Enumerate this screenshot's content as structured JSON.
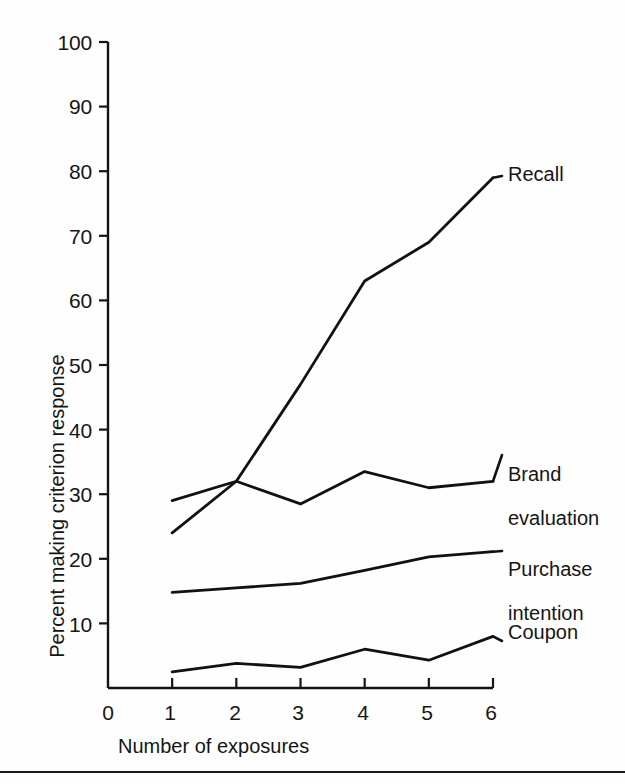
{
  "chart_data": {
    "type": "line",
    "title": "",
    "xlabel": "Number of exposures",
    "ylabel": "Percent making criterion response",
    "x": [
      1,
      2,
      3,
      4,
      5,
      6
    ],
    "xlim": [
      0,
      6
    ],
    "ylim": [
      0,
      100
    ],
    "xticks": [
      "0",
      "1",
      "2",
      "3",
      "4",
      "5",
      "6"
    ],
    "yticks": [
      "10",
      "20",
      "30",
      "40",
      "50",
      "60",
      "70",
      "80",
      "90",
      "100"
    ],
    "grid": false,
    "legend_position": "right-inline-annotations",
    "series": [
      {
        "name": "Recall",
        "values": [
          24,
          32,
          47,
          63,
          69,
          79
        ]
      },
      {
        "name": "Brand evaluation",
        "values": [
          29,
          32,
          28.5,
          33.5,
          31,
          32
        ]
      },
      {
        "name": "Purchase intention",
        "values": [
          14.8,
          15.5,
          16.2,
          18.2,
          20.3,
          21.1
        ]
      },
      {
        "name": "Coupon",
        "values": [
          2.5,
          3.8,
          3.2,
          6.0,
          4.3,
          8.0
        ]
      }
    ],
    "annotations": [
      {
        "text": "Recall",
        "for": "Recall"
      },
      {
        "text": "Brand\nevaluation",
        "for": "Brand evaluation"
      },
      {
        "text": "Purchase\nintention",
        "for": "Purchase intention"
      },
      {
        "text": "Coupon",
        "for": "Coupon"
      }
    ],
    "line_color": "#111111"
  },
  "axis": {
    "y_ticks": [
      {
        "label": "100",
        "value": 100
      },
      {
        "label": "90",
        "value": 90
      },
      {
        "label": "80",
        "value": 80
      },
      {
        "label": "70",
        "value": 70
      },
      {
        "label": "60",
        "value": 60
      },
      {
        "label": "50",
        "value": 50
      },
      {
        "label": "40",
        "value": 40
      },
      {
        "label": "30",
        "value": 30
      },
      {
        "label": "20",
        "value": 20
      },
      {
        "label": "10",
        "value": 10
      }
    ],
    "x_ticks": [
      {
        "label": "0",
        "value": 0
      },
      {
        "label": "1",
        "value": 1
      },
      {
        "label": "2",
        "value": 2
      },
      {
        "label": "3",
        "value": 3
      },
      {
        "label": "4",
        "value": 4
      },
      {
        "label": "5",
        "value": 5
      },
      {
        "label": "6",
        "value": 6
      }
    ],
    "x_title": "Number of exposures",
    "y_title": "Percent making criterion response"
  },
  "labels": {
    "recall": "Recall",
    "brand_evaluation_line1": "Brand",
    "brand_evaluation_line2": "evaluation",
    "purchase_intention_line1": "Purchase",
    "purchase_intention_line2": "intention",
    "coupon": "Coupon"
  }
}
